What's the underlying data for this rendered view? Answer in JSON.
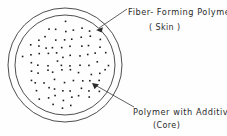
{
  "figure": {
    "name": "bicomponent-fiber-cross-section",
    "background_color": "#fefefe",
    "line_color": "#3a3a3a",
    "text_color": "#2b2b2b"
  },
  "diagram": {
    "outer_circle": {
      "cx": 65,
      "cy": 65,
      "r": 57,
      "label": "outer-boundary"
    },
    "inner_circle": {
      "cx": 65,
      "cy": 65,
      "r": 50,
      "label": "core-boundary"
    },
    "dot_fill": {
      "count": 118,
      "dot_size": 1.6,
      "color": "#1c1c1c"
    }
  },
  "labels": {
    "skin": {
      "title": "Fiber- Forming Polymer",
      "subtitle": "( Skin )"
    },
    "core": {
      "title": "Polymer with Additive",
      "subtitle": "(Core)"
    }
  },
  "leaders": {
    "skin_arrow": {
      "from_x": 127,
      "from_y": 9,
      "to_x": 96,
      "to_y": 30
    },
    "core_arrow": {
      "from_x": 134,
      "from_y": 107,
      "to_x": 92,
      "to_y": 83
    }
  }
}
